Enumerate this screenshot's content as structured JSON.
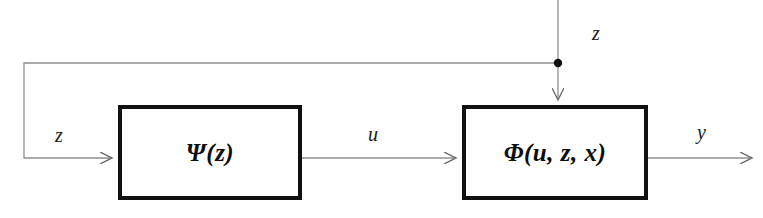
{
  "diagram": {
    "type": "block-diagram",
    "title": "",
    "background_color": "#ffffff",
    "line_color": "#8a8a8a",
    "block_border_color": "#111111",
    "text_color": "#0d0d0d",
    "blocks": [
      {
        "id": "psi",
        "label": "Ψ(z)",
        "x": 118,
        "y": 105,
        "width": 184,
        "height": 95
      },
      {
        "id": "phi",
        "label": "Φ(u, z, x)",
        "x": 462,
        "y": 105,
        "width": 186,
        "height": 95
      }
    ],
    "signals": [
      {
        "id": "z-feedback",
        "label": "z",
        "description": "feedback input into block psi"
      },
      {
        "id": "z-top",
        "label": "z",
        "description": "external input into top of block phi"
      },
      {
        "id": "u",
        "label": "u",
        "description": "output of psi into phi"
      },
      {
        "id": "y",
        "label": "y",
        "description": "output of phi"
      }
    ],
    "junction": {
      "id": "z-junction",
      "x": 558,
      "y": 63,
      "radius": 4
    }
  }
}
